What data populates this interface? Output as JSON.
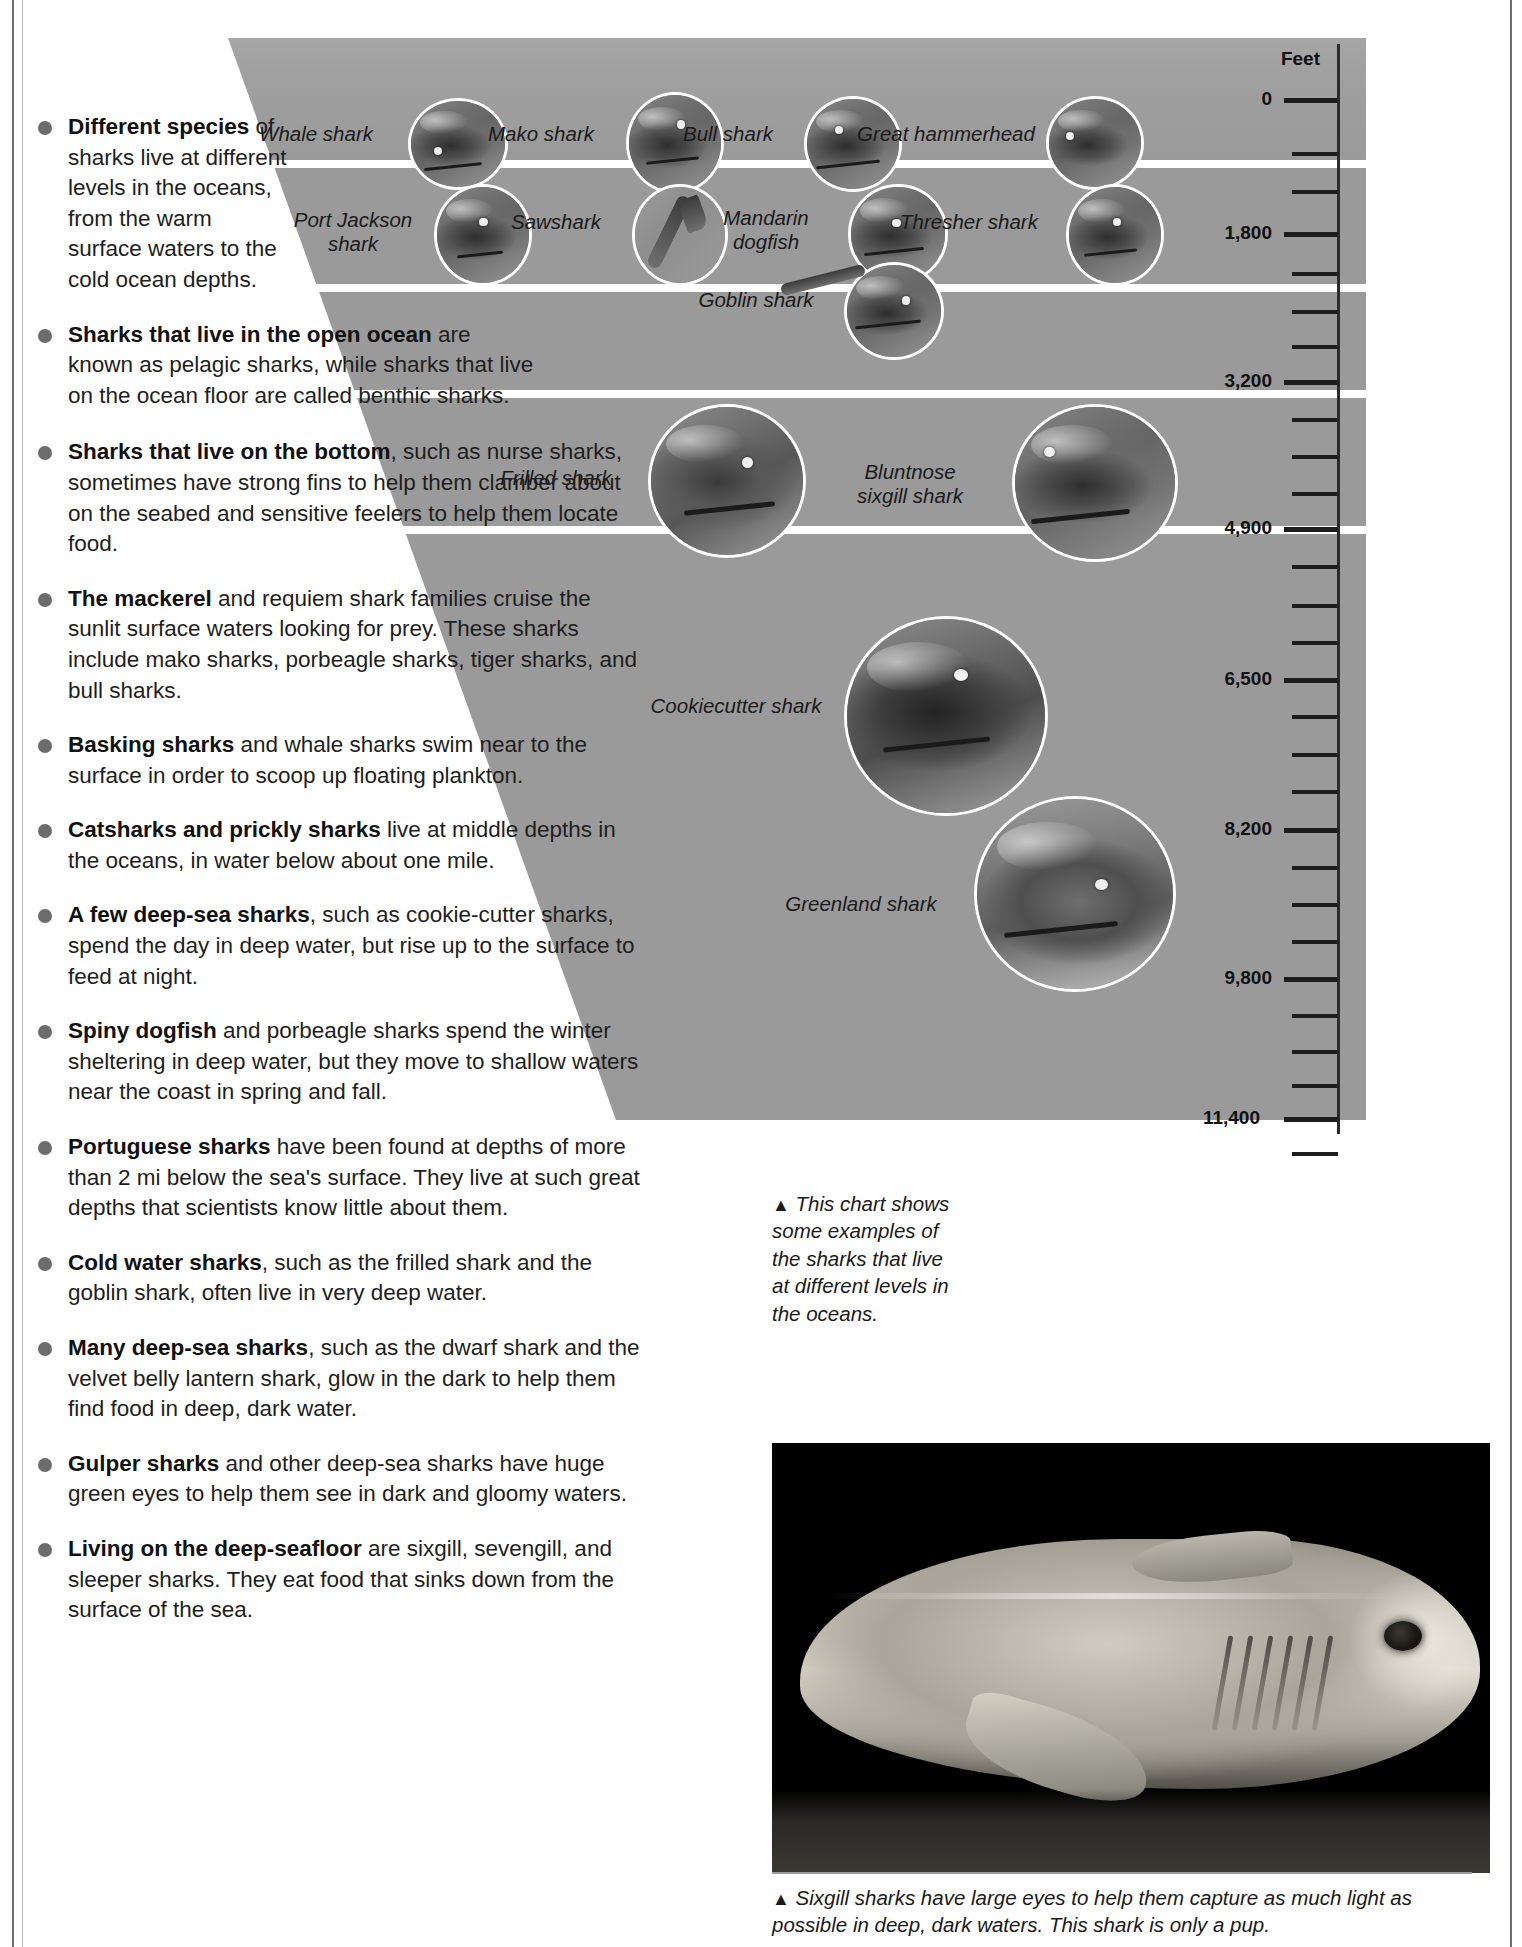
{
  "chart": {
    "axis_title": "Feet",
    "tick_labels": [
      "0",
      "1,800",
      "3,200",
      "4,900",
      "6,500",
      "8,200",
      "9,800",
      "11,400"
    ],
    "caption_marker": "▲",
    "caption": " This chart shows some examples of the sharks that live at different levels in the oceans.",
    "sharks": [
      {
        "name": "Whale shark"
      },
      {
        "name": "Mako shark"
      },
      {
        "name": "Bull shark"
      },
      {
        "name": "Great hammerhead"
      },
      {
        "name": "Port Jackson\nshark"
      },
      {
        "name": "Sawshark"
      },
      {
        "name": "Mandarin\ndogfish"
      },
      {
        "name": "Thresher shark"
      },
      {
        "name": "Goblin shark"
      },
      {
        "name": "Frilled shark"
      },
      {
        "name": "Bluntnose\nsixgill shark"
      },
      {
        "name": "Cookiecutter shark"
      },
      {
        "name": "Greenland shark"
      }
    ]
  },
  "photo": {
    "caption_marker": "▲",
    "caption": " Sixgill sharks have large eyes to help them capture as much light as possible in deep, dark waters. This shark is only a pup."
  },
  "bullets": [
    {
      "lead": "Different species",
      "rest": " of sharks live at different levels in the oceans, from the warm surface waters to the cold ocean depths."
    },
    {
      "lead": "Sharks that live in the open ocean",
      "rest": " are known as pelagic sharks, while sharks that live on the ocean floor are called benthic sharks."
    },
    {
      "lead": "Sharks that live on the bottom",
      "rest": ", such as nurse sharks, sometimes have strong fins to help them clamber about on the seabed and sensitive feelers to help them locate food."
    },
    {
      "lead": "The mackerel",
      "rest": " and requiem shark families cruise the sunlit surface waters looking for prey. These sharks include mako sharks, porbeagle sharks, tiger sharks, and bull sharks."
    },
    {
      "lead": "Basking sharks",
      "rest": " and whale sharks swim near to the surface in order to scoop up floating plankton."
    },
    {
      "lead": "Catsharks and prickly sharks",
      "rest": " live at middle depths in the oceans, in water below about one mile."
    },
    {
      "lead": "A few deep-sea sharks",
      "rest": ", such as cookie-cutter sharks, spend the day in deep water, but rise up to the surface to feed at night."
    },
    {
      "lead": "Spiny dogfish",
      "rest": " and porbeagle sharks spend the winter sheltering in deep water, but they move to shallow waters near the coast in spring and fall."
    },
    {
      "lead": "Portuguese sharks",
      "rest": " have been found at depths of more than 2 mi below the sea's surface. They live at such great depths that scientists know little about them."
    },
    {
      "lead": "Cold water sharks",
      "rest": ", such as the frilled shark and the goblin shark, often live in very deep water."
    },
    {
      "lead": "Many deep-sea sharks",
      "rest": ", such as the dwarf shark and the velvet belly lantern shark, glow in the dark to help them find food in deep, dark water."
    },
    {
      "lead": "Gulper sharks",
      "rest": " and other deep-sea sharks have huge green eyes to help them see in dark and gloomy waters."
    },
    {
      "lead": "Living on the deep-seafloor",
      "rest": " are sixgill, sevengill, and sleeper sharks. They eat food that sinks down from the surface of the sea."
    }
  ],
  "colors": {
    "water": "#9a9a9a",
    "bullet_dot": "#6c6c6c",
    "axis": "#1d1d1d",
    "text": "#1e1e1e"
  }
}
